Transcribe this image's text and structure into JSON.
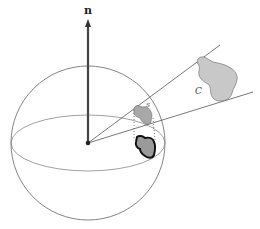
{
  "diagram": {
    "labels": {
      "normal": "n",
      "projected_patch": "s",
      "surface_patch": "C"
    },
    "colors": {
      "stroke": "#555555",
      "normal_vector": "#444444",
      "patch_fill": "#a8a8a8",
      "surface_fill": "#c8c8c8",
      "shadow_outline": "#111111"
    },
    "elements": [
      "sphere",
      "equator",
      "normal-vector",
      "cone-upper-ray",
      "cone-lower-ray",
      "projected-patch",
      "shadow-patch",
      "surface-patch"
    ]
  }
}
